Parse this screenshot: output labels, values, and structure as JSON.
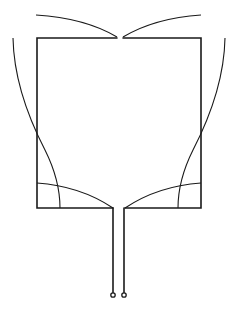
{
  "diagram": {
    "type": "line-drawing",
    "colors": {
      "stroke": "#1a1a1a",
      "background": "#ffffff"
    },
    "elements": {
      "square": {
        "left": 37,
        "right": 201,
        "top": 38,
        "bottom": 208,
        "gap": [
          117,
          123
        ]
      },
      "feed_lines": [
        {
          "x": 113,
          "y1": 208,
          "y2": 293
        },
        {
          "x": 124,
          "y1": 208,
          "y2": 293
        }
      ],
      "terminals": [
        {
          "cx": 113,
          "cy": 295,
          "r": 2.2
        },
        {
          "cx": 124,
          "cy": 295,
          "r": 2.2
        }
      ]
    }
  }
}
